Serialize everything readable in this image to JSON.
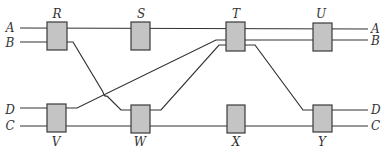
{
  "diagram": {
    "type": "track-switching-network",
    "colors": {
      "line": "#333333",
      "box_fill": "#c4c4c4",
      "box_stroke": "#3a3a3a",
      "background": "#ffffff"
    },
    "line_labels_left": [
      {
        "id": "A",
        "label": "A",
        "x": 10,
        "y": 32
      },
      {
        "id": "B",
        "label": "B",
        "x": 10,
        "y": 47
      },
      {
        "id": "D",
        "label": "D",
        "x": 10,
        "y": 114
      },
      {
        "id": "C",
        "label": "C",
        "x": 10,
        "y": 130
      }
    ],
    "line_labels_right": [
      {
        "id": "A",
        "label": "A",
        "x": 371,
        "y": 33
      },
      {
        "id": "B",
        "label": "B",
        "x": 371,
        "y": 45
      },
      {
        "id": "D",
        "label": "D",
        "x": 371,
        "y": 114
      },
      {
        "id": "C",
        "label": "C",
        "x": 371,
        "y": 130
      }
    ],
    "boxes_top": [
      {
        "id": "R",
        "label": "R",
        "x": 47,
        "y": 22,
        "w": 20,
        "h": 28,
        "label_x": 57,
        "label_y": 18
      },
      {
        "id": "S",
        "label": "S",
        "x": 131,
        "y": 22,
        "w": 19,
        "h": 28,
        "label_x": 141,
        "label_y": 18
      },
      {
        "id": "T",
        "label": "T",
        "x": 226,
        "y": 22,
        "w": 19,
        "h": 29,
        "label_x": 236,
        "label_y": 18
      },
      {
        "id": "U",
        "label": "U",
        "x": 313,
        "y": 23,
        "w": 19,
        "h": 28,
        "label_x": 321,
        "label_y": 18
      }
    ],
    "boxes_bottom": [
      {
        "id": "V",
        "label": "V",
        "x": 47,
        "y": 104,
        "w": 19,
        "h": 28,
        "label_x": 56,
        "label_y": 146
      },
      {
        "id": "W",
        "label": "W",
        "x": 131,
        "y": 105,
        "w": 19,
        "h": 28,
        "label_x": 140,
        "label_y": 146
      },
      {
        "id": "X",
        "label": "X",
        "x": 227,
        "y": 105,
        "w": 18,
        "h": 28,
        "label_x": 236,
        "label_y": 146
      },
      {
        "id": "Y",
        "label": "Y",
        "x": 313,
        "y": 105,
        "w": 19,
        "h": 27,
        "label_x": 322,
        "label_y": 146
      }
    ],
    "paths": [
      {
        "id": "line-A",
        "d": "M20,28 L368,29"
      },
      {
        "id": "line-B-left",
        "d": "M20,42 L73,42 L103,92 M107,96 L121,110 L161,110 L219,45 L255,45 L303,110 L368,110"
      },
      {
        "id": "line-D-left",
        "d": "M20,108 L77,108 L216,40 L368,40"
      },
      {
        "id": "line-C",
        "d": "M20,126 L368,126"
      },
      {
        "id": "crossing-hop",
        "d": "M103,92 Q104,97 107,96"
      }
    ]
  }
}
